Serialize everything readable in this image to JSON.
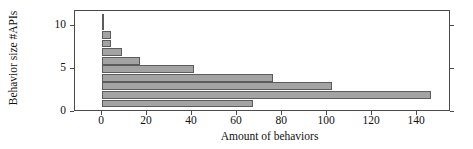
{
  "chart_data": {
    "type": "bar",
    "orientation": "horizontal",
    "title": "",
    "xlabel": "Amount of behaviors",
    "ylabel": "Behavior size #APIs",
    "xlim": [
      -12,
      155
    ],
    "ylim": [
      0,
      11.8
    ],
    "xticks": [
      0,
      20,
      40,
      60,
      80,
      100,
      120,
      140
    ],
    "yticks": [
      0,
      5,
      10
    ],
    "xticklabels": [
      "0",
      "20",
      "40",
      "60",
      "80",
      "100",
      "120",
      "140"
    ],
    "yticklabels": [
      "0",
      "5",
      "10"
    ],
    "grid": false,
    "legend": null,
    "bar_color": "#a3a3a3",
    "bar_edge_color": "#5c5c5c",
    "categories": [
      1,
      2,
      3,
      4,
      5,
      6,
      7,
      8,
      9,
      10,
      11
    ],
    "values": [
      67,
      146,
      102,
      76,
      41,
      17,
      9,
      4,
      4,
      1,
      1
    ],
    "bars": [
      {
        "y": 1,
        "value": 67
      },
      {
        "y": 2,
        "value": 146
      },
      {
        "y": 3,
        "value": 102
      },
      {
        "y": 4,
        "value": 76
      },
      {
        "y": 5,
        "value": 41
      },
      {
        "y": 6,
        "value": 17
      },
      {
        "y": 7,
        "value": 9
      },
      {
        "y": 8,
        "value": 4
      },
      {
        "y": 9,
        "value": 4
      },
      {
        "y": 10,
        "value": 1
      },
      {
        "y": 11,
        "value": 1
      }
    ]
  }
}
